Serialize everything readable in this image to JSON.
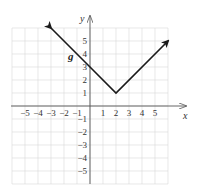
{
  "chart_data": {
    "type": "line",
    "title": "",
    "xlabel": "x",
    "ylabel": "y",
    "xlim": [
      -6,
      6
    ],
    "ylim": [
      -6,
      6
    ],
    "grid": true,
    "x_ticks": [
      "-5",
      "-4",
      "-3",
      "-2",
      "-1",
      "1",
      "2",
      "3",
      "4",
      "5"
    ],
    "y_ticks": [
      "5",
      "4",
      "3",
      "2",
      "1",
      "-1",
      "-2",
      "-3",
      "-4",
      "-5"
    ],
    "series": [
      {
        "name": "g",
        "description": "V-shaped absolute value graph with vertex at (2, 1), y-intercept 3, arrows on both ends",
        "points": [
          [
            -3,
            6
          ],
          [
            0,
            3
          ],
          [
            2,
            1
          ],
          [
            6,
            5
          ]
        ],
        "color": "#1a1a1a"
      }
    ],
    "annotations": [
      {
        "text": "g",
        "x": -0.8,
        "y": 4
      }
    ]
  },
  "labels": {
    "x_axis": "x",
    "y_axis": "y",
    "function": "g"
  }
}
